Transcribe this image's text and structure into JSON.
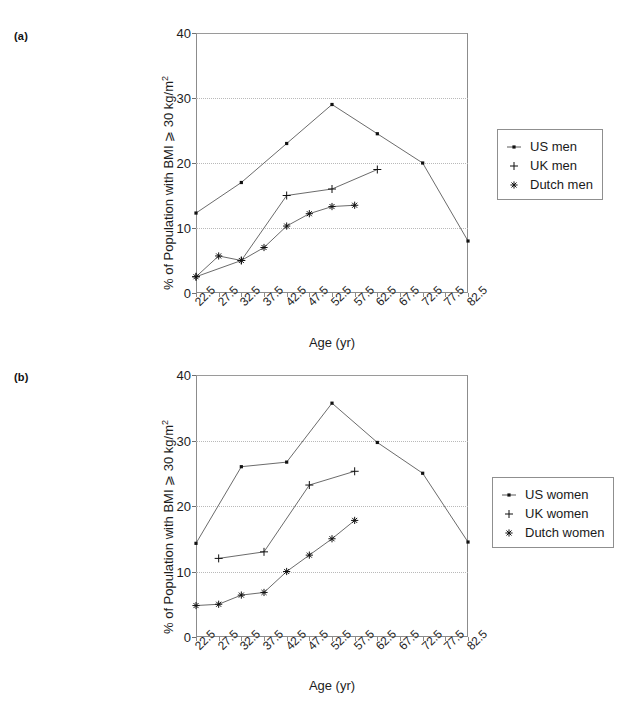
{
  "figure": {
    "panels": [
      {
        "tag": "(a)",
        "legend_title": "men",
        "legend": [
          {
            "label": "US men",
            "marker": "dot"
          },
          {
            "label": "UK men",
            "marker": "plus"
          },
          {
            "label": "Dutch men",
            "marker": "asterisk"
          }
        ]
      },
      {
        "tag": "(b)",
        "legend_title": "women",
        "legend": [
          {
            "label": "US women",
            "marker": "dot"
          },
          {
            "label": "UK women",
            "marker": "plus"
          },
          {
            "label": "Dutch women",
            "marker": "asterisk"
          }
        ]
      }
    ]
  },
  "axis": {
    "xlabel": "Age (yr)",
    "ylabel_text": "% of Population with BMI ⩾ 30 kg/m",
    "ylabel_sup": "2",
    "xticks": [
      "22.5",
      "27.5",
      "32.5",
      "37.5",
      "42.5",
      "47.5",
      "52.5",
      "57.5",
      "62.5",
      "67.5",
      "72.5",
      "77.5",
      "82.5"
    ],
    "yticks": [
      "0",
      "10",
      "20",
      "30",
      "40"
    ],
    "ylim": [
      0,
      40
    ],
    "gridvalues": [
      10,
      20,
      30
    ]
  },
  "chart_data": [
    {
      "type": "line",
      "panel": "(a)",
      "title": "(a)",
      "xlabel": "Age (yr)",
      "ylabel": "% of Population with BMI ⩾ 30 kg/m2",
      "categories": [
        "22.5",
        "27.5",
        "32.5",
        "37.5",
        "42.5",
        "47.5",
        "52.5",
        "57.5",
        "62.5",
        "67.5",
        "72.5",
        "77.5",
        "82.5"
      ],
      "ylim": [
        0,
        40
      ],
      "xlim": [
        22.5,
        82.5
      ],
      "grid": "horizontal-dotted",
      "legend_position": "right-outside",
      "series": [
        {
          "name": "US men",
          "marker": "dot",
          "x": [
            22.5,
            32.5,
            42.5,
            52.5,
            62.5,
            72.5,
            82.5
          ],
          "values": [
            12.3,
            17.0,
            23.0,
            29.0,
            24.5,
            20.0,
            8.0
          ]
        },
        {
          "name": "UK men",
          "marker": "plus",
          "x": [
            22.5,
            32.5,
            42.5,
            52.5,
            62.5
          ],
          "values": [
            2.5,
            5.0,
            15.0,
            16.0,
            19.0
          ]
        },
        {
          "name": "Dutch men",
          "marker": "asterisk",
          "x": [
            22.5,
            27.5,
            32.5,
            37.5,
            42.5,
            47.5,
            52.5,
            57.5
          ],
          "values": [
            2.5,
            5.7,
            5.0,
            7.0,
            10.3,
            12.2,
            13.3,
            13.5
          ]
        }
      ]
    },
    {
      "type": "line",
      "panel": "(b)",
      "title": "(b)",
      "xlabel": "Age (yr)",
      "ylabel": "% of Population with BMI ⩾ 30 kg/m2",
      "categories": [
        "22.5",
        "27.5",
        "32.5",
        "37.5",
        "42.5",
        "47.5",
        "52.5",
        "57.5",
        "62.5",
        "67.5",
        "72.5",
        "77.5",
        "82.5"
      ],
      "ylim": [
        0,
        40
      ],
      "xlim": [
        22.5,
        82.5
      ],
      "grid": "horizontal-dotted",
      "legend_position": "right-outside",
      "series": [
        {
          "name": "US women",
          "marker": "dot",
          "x": [
            22.5,
            32.5,
            42.5,
            52.5,
            62.5,
            72.5,
            82.5
          ],
          "values": [
            14.3,
            26.0,
            26.7,
            35.7,
            29.7,
            25.0,
            14.5
          ]
        },
        {
          "name": "UK women",
          "marker": "plus",
          "x": [
            27.5,
            37.5,
            47.5,
            57.5
          ],
          "values": [
            12.0,
            13.0,
            23.2,
            25.3
          ]
        },
        {
          "name": "Dutch women",
          "marker": "asterisk",
          "x": [
            22.5,
            27.5,
            32.5,
            37.5,
            42.5,
            47.5,
            52.5,
            57.5
          ],
          "values": [
            4.8,
            5.0,
            6.4,
            6.8,
            10.0,
            12.5,
            15.0,
            17.8
          ]
        }
      ]
    }
  ],
  "colors": {
    "line": "#5a5a5a",
    "marker": "#111111",
    "axis": "#8c8c8c",
    "grid": "#b9b9b9",
    "text": "#1a1a1a"
  }
}
